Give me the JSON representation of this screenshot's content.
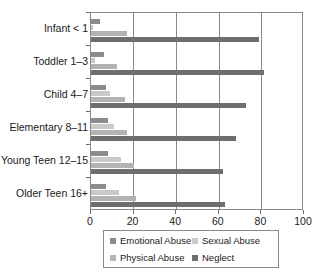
{
  "chart_data": {
    "type": "bar",
    "orientation": "horizontal",
    "title": "",
    "xlabel": "",
    "ylabel": "",
    "xlim": [
      0,
      100
    ],
    "ylim": null,
    "grid": "vertical",
    "legend_position": "bottom",
    "categories": [
      "Infant < 1",
      "Toddler 1–3",
      "Child 4–7",
      "Elementary 8–11",
      "Young Teen 12–15",
      "Older Teen 16+"
    ],
    "xticks": [
      0,
      20,
      40,
      60,
      80,
      100
    ],
    "xticklabels": [
      "0",
      "20",
      "40",
      "60",
      "80",
      "100"
    ],
    "series": [
      {
        "name": "Emotional Abuse",
        "color": "#8c8c8c",
        "values": [
          4,
          6,
          7,
          8,
          8,
          7
        ]
      },
      {
        "name": "Sexual Abuse",
        "color": "#c9c9c9",
        "values": [
          1,
          2,
          9,
          11,
          14,
          13
        ]
      },
      {
        "name": "Physical Abuse",
        "color": "#b3b3b3",
        "values": [
          17,
          12,
          16,
          17,
          20,
          21
        ]
      },
      {
        "name": "Neglect",
        "color": "#6e6e6e",
        "values": [
          79,
          81,
          73,
          68,
          62,
          63
        ]
      }
    ]
  },
  "legend": {
    "items": [
      {
        "label": "Emotional Abuse",
        "key": "emotional"
      },
      {
        "label": "Sexual Abuse",
        "key": "sexual"
      },
      {
        "label": "Physical Abuse",
        "key": "physical"
      },
      {
        "label": "Neglect",
        "key": "neglect"
      }
    ]
  }
}
